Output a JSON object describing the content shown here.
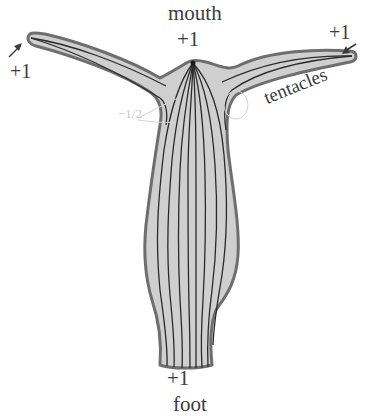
{
  "figure": {
    "colors": {
      "body_fill": "#cfcfcf",
      "body_outline": "#6e6e6e",
      "fiber_lines": "#2a2a2a",
      "label_text": "#3c3c3c",
      "faint_label": "#c9c9c9",
      "arrow": "#3a3a3a"
    }
  },
  "labels": {
    "mouth": "mouth",
    "mouth_charge": "+1",
    "left_tentacle_tip_charge": "+1",
    "right_tentacle_tip_charge": "+1",
    "tentacles": "tentacles",
    "left_junction_charge": "−1/2",
    "foot_charge": "+1",
    "foot": "foot"
  },
  "defects": [
    {
      "location": "mouth",
      "charge": "+1"
    },
    {
      "location": "left tentacle tip",
      "charge": "+1"
    },
    {
      "location": "right tentacle tip",
      "charge": "+1"
    },
    {
      "location": "left tentacle base",
      "charge": "−1/2"
    },
    {
      "location": "right tentacle base",
      "charge": "−1/2"
    },
    {
      "location": "foot",
      "charge": "+1"
    }
  ]
}
